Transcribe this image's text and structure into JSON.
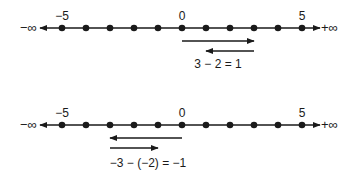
{
  "diagram": {
    "colors": {
      "ink": "#1a1a1a",
      "background": "#ffffff"
    },
    "number_lines": [
      {
        "id": "top",
        "left_end_label": "−∞",
        "right_end_label": "+∞",
        "tick_labels": {
          "-5": "−5",
          "0": "0",
          "5": "5"
        },
        "points": [
          -5,
          -4,
          -3,
          -2,
          -1,
          0,
          1,
          2,
          3,
          4,
          5
        ],
        "arrows": [
          {
            "from": 0,
            "to": 3,
            "direction": "right"
          },
          {
            "from": 3,
            "to": 1,
            "direction": "left"
          }
        ],
        "equation": "3 − 2 = 1"
      },
      {
        "id": "bottom",
        "left_end_label": "−∞",
        "right_end_label": "+∞",
        "tick_labels": {
          "-5": "−5",
          "0": "0",
          "5": "5"
        },
        "points": [
          -5,
          -4,
          -3,
          -2,
          -1,
          0,
          1,
          2,
          3,
          4,
          5
        ],
        "arrows": [
          {
            "from": 0,
            "to": -3,
            "direction": "left"
          },
          {
            "from": -3,
            "to": -1,
            "direction": "right"
          }
        ],
        "equation": "−3 − (−2) = −1"
      }
    ]
  }
}
